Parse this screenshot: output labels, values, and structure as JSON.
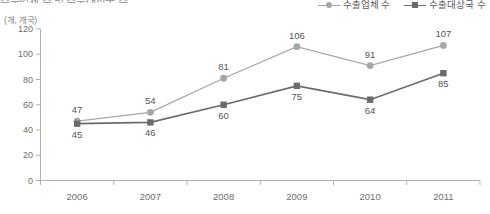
{
  "title_fragment": "수출업체 수 및 수출대상국 수",
  "unit_label": "(개, 개국)",
  "legend": {
    "items": [
      {
        "label": "수출업체 수",
        "marker": "circle-marker-icon",
        "color": "#a6a6a6"
      },
      {
        "label": "수출대상국 수",
        "marker": "square-marker-icon",
        "color": "#6b6b6b"
      }
    ]
  },
  "colors": {
    "series_companies": "#a6a6a6",
    "series_countries": "#6b6b6b",
    "axis": "#b0b0b0",
    "text": "#6d6d6d",
    "background": "#ffffff"
  },
  "chart_data": {
    "type": "line",
    "title": "수출업체 수 및 수출대상국 수",
    "xlabel": "",
    "ylabel": "(개, 개국)",
    "categories": [
      "2006",
      "2007",
      "2008",
      "2009",
      "2010",
      "2011"
    ],
    "yticks": [
      0,
      20,
      40,
      60,
      80,
      100,
      120
    ],
    "ylim": [
      0,
      120
    ],
    "grid": false,
    "legend_position": "top-right",
    "series": [
      {
        "name": "수출업체 수",
        "marker": "circle",
        "color": "#a6a6a6",
        "values": [
          47,
          54,
          81,
          106,
          91,
          107
        ],
        "label_positions": [
          "above",
          "above",
          "above",
          "above",
          "above",
          "above"
        ]
      },
      {
        "name": "수출대상국 수",
        "marker": "square",
        "color": "#6b6b6b",
        "values": [
          45,
          46,
          60,
          75,
          64,
          85
        ],
        "label_positions": [
          "below",
          "below",
          "below",
          "below",
          "below",
          "below"
        ]
      }
    ]
  }
}
